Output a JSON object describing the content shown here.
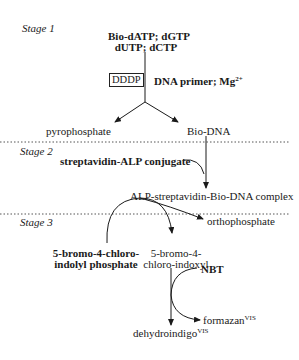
{
  "stages": {
    "stage1": "Stage 1",
    "stage2": "Stage 2",
    "stage3": "Stage 3"
  },
  "stage1": {
    "reactants_line1": "Bio-dATP; dGTP",
    "reactants_line2": "dUTP; dCTP",
    "enzyme_box": "DDDP",
    "cofactors": "DNA primer; Mg",
    "cofactors_sup": "2+",
    "product_left": "pyrophosphate",
    "product_right": "Bio-DNA"
  },
  "stage2": {
    "reagent": "streptavidin-ALP conjugate",
    "product": "ALP-streptavidin-Bio-DNA complex"
  },
  "stage3": {
    "byproduct": "orthophosphate",
    "substrate_line1": "5-bromo-4-chloro-",
    "substrate_line2": "indolyl phosphate",
    "intermediate_line1": "5-bromo-4-",
    "intermediate_line2": "chloro-indoxyl",
    "reagent": "NBT",
    "product_right": "formazan",
    "product_right_sup": "VIS",
    "product_bottom": "dehydroindigo",
    "product_bottom_sup": "VIS"
  },
  "colors": {
    "ink": "#1a1a1a",
    "divider": "#555555"
  }
}
